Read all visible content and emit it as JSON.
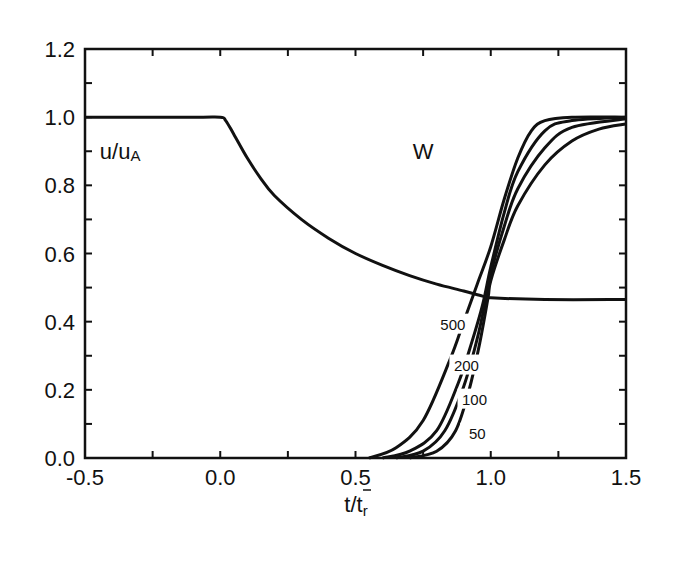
{
  "chart_data": {
    "type": "line",
    "title": "",
    "xlabel": "t/t̄r",
    "xlabel_main": "t/t",
    "xlabel_sub": "r",
    "ylabel": "",
    "xlim": [
      -0.5,
      1.5
    ],
    "ylim": [
      0.0,
      1.2
    ],
    "x_ticks": [
      "-0.5",
      "0.0",
      "0.5",
      "1.0",
      "1.5"
    ],
    "y_ticks": [
      "0.0",
      "0.2",
      "0.4",
      "0.6",
      "0.8",
      "1.0",
      "1.2"
    ],
    "grid": false,
    "legend": "none",
    "annotations": [
      {
        "text": "u/uA",
        "main": "u/u",
        "sub": "A",
        "x": -0.37,
        "y": 0.9
      },
      {
        "text": "W",
        "x": 0.75,
        "y": 0.9
      },
      {
        "text": "500",
        "x": 0.86,
        "y": 0.4
      },
      {
        "text": "200",
        "x": 0.91,
        "y": 0.28
      },
      {
        "text": "100",
        "x": 0.94,
        "y": 0.18
      },
      {
        "text": "50",
        "x": 0.95,
        "y": 0.08
      }
    ],
    "series": [
      {
        "name": "u/uA",
        "x": [
          -0.5,
          -0.1,
          0.0,
          0.02,
          0.05,
          0.1,
          0.15,
          0.2,
          0.3,
          0.4,
          0.5,
          0.6,
          0.7,
          0.8,
          0.9,
          0.97,
          1.0,
          1.2,
          1.5
        ],
        "y": [
          1.0,
          1.0,
          1.0,
          0.99,
          0.95,
          0.88,
          0.82,
          0.77,
          0.7,
          0.645,
          0.6,
          0.565,
          0.535,
          0.51,
          0.49,
          0.475,
          0.47,
          0.465,
          0.465
        ]
      },
      {
        "name": "W (500)",
        "x": [
          0.55,
          0.65,
          0.75,
          0.85,
          0.9,
          0.95,
          1.0,
          1.05,
          1.1,
          1.15,
          1.2,
          1.3,
          1.5
        ],
        "y": [
          0.0,
          0.03,
          0.11,
          0.29,
          0.4,
          0.51,
          0.62,
          0.76,
          0.88,
          0.96,
          0.99,
          1.0,
          1.0
        ]
      },
      {
        "name": "W (200)",
        "x": [
          0.6,
          0.7,
          0.8,
          0.88,
          0.93,
          0.97,
          1.0,
          1.05,
          1.1,
          1.2,
          1.3,
          1.5
        ],
        "y": [
          0.0,
          0.02,
          0.08,
          0.22,
          0.34,
          0.45,
          0.56,
          0.72,
          0.84,
          0.96,
          0.99,
          1.0
        ]
      },
      {
        "name": "W (100)",
        "x": [
          0.65,
          0.75,
          0.83,
          0.9,
          0.95,
          0.98,
          1.0,
          1.05,
          1.1,
          1.2,
          1.3,
          1.5
        ],
        "y": [
          0.0,
          0.02,
          0.08,
          0.21,
          0.35,
          0.46,
          0.54,
          0.68,
          0.79,
          0.91,
          0.97,
          0.995
        ]
      },
      {
        "name": "W (50)",
        "x": [
          0.7,
          0.8,
          0.87,
          0.92,
          0.96,
          0.99,
          1.0,
          1.05,
          1.1,
          1.2,
          1.3,
          1.4,
          1.5
        ],
        "y": [
          0.0,
          0.02,
          0.08,
          0.2,
          0.34,
          0.47,
          0.52,
          0.64,
          0.74,
          0.86,
          0.93,
          0.965,
          0.98
        ]
      }
    ]
  }
}
